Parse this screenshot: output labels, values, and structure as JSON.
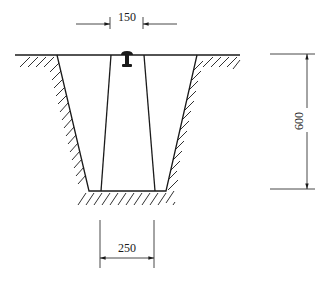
{
  "diagram": {
    "type": "trench cross-section",
    "dimensions": {
      "top_width": {
        "label": "150"
      },
      "depth": {
        "label": "600"
      },
      "bottom_width": {
        "label": "250"
      }
    },
    "colors": {
      "line": "#1a1a1a",
      "background": "#ffffff"
    }
  }
}
